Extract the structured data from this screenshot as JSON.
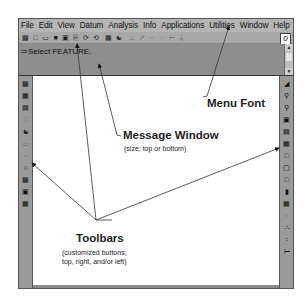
{
  "menubar": {
    "items": [
      "File",
      "Edit",
      "View",
      "Datum",
      "Analysis",
      "Info",
      "Applications",
      "Utilities",
      "Window",
      "Help"
    ]
  },
  "toolbar_top": {
    "buttons": [
      "new-icon",
      "open-icon",
      "folder-icon",
      "save-icon",
      "save-as-icon",
      "print-icon",
      "regen-icon",
      "undo-icon",
      "feature-icon",
      "model-tree-icon",
      "datum-plane-icon",
      "datum-axis-icon",
      "datum-curve-icon",
      "datum-point-icon",
      "coord-sys-icon",
      "spin-center-icon"
    ],
    "logo": "0"
  },
  "message_window": {
    "text": "⇨Select FEATURE."
  },
  "left_toolbar": {
    "buttons": [
      "tb-1",
      "tb-2",
      "tb-3",
      "tb-4",
      "tb-5",
      "tb-6",
      "tb-7",
      "tb-8",
      "tb-9",
      "tb-10"
    ]
  },
  "right_toolbar": {
    "buttons": [
      "repaint",
      "zoom-in",
      "zoom-out",
      "refit",
      "orient",
      "saved-views",
      "wireframe",
      "hidden-line",
      "no-hidden",
      "shade",
      "layers",
      "datum-planes",
      "datum-axes",
      "datum-points",
      "coord-systems"
    ]
  },
  "annotations": {
    "menu_font": "Menu Font",
    "message_window_title": "Message Window",
    "message_window_sub": "(size; top or bottom)",
    "toolbars_title": "Toolbars",
    "toolbars_sub1": "(customized buttons;",
    "toolbars_sub2": "top, right, and/or left)"
  }
}
